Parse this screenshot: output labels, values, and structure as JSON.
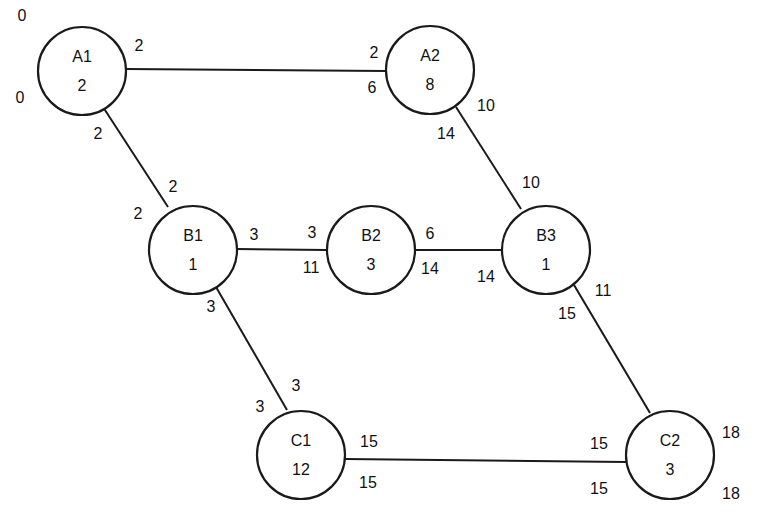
{
  "diagram": {
    "type": "network-schedule",
    "nodes": [
      {
        "id": "A1",
        "name": "A1",
        "duration": "2",
        "cx": 82,
        "cy": 71,
        "r": 44,
        "labels": [
          {
            "text": "0",
            "x": 22,
            "y": 17
          },
          {
            "text": "0",
            "x": 20,
            "y": 99
          }
        ]
      },
      {
        "id": "A2",
        "name": "A2",
        "duration": "8",
        "cx": 430,
        "cy": 70,
        "r": 44,
        "labels": []
      },
      {
        "id": "B1",
        "name": "B1",
        "duration": "1",
        "cx": 193,
        "cy": 250,
        "r": 44,
        "labels": []
      },
      {
        "id": "B2",
        "name": "B2",
        "duration": "3",
        "cx": 371,
        "cy": 250,
        "r": 44,
        "labels": []
      },
      {
        "id": "B3",
        "name": "B3",
        "duration": "1",
        "cx": 546,
        "cy": 250,
        "r": 44,
        "labels": []
      },
      {
        "id": "C1",
        "name": "C1",
        "duration": "12",
        "cx": 301,
        "cy": 455,
        "r": 44,
        "labels": []
      },
      {
        "id": "C2",
        "name": "C2",
        "duration": "3",
        "cx": 670,
        "cy": 455,
        "r": 44,
        "labels": [
          {
            "text": "18",
            "x": 731,
            "y": 434
          },
          {
            "text": "18",
            "x": 731,
            "y": 495
          }
        ]
      }
    ],
    "edges": [
      {
        "from": "A1",
        "to": "A2",
        "x1": 126,
        "y1": 69,
        "x2": 386,
        "y2": 71,
        "labels": [
          {
            "text": "2",
            "x": 139,
            "y": 47
          },
          {
            "text": "2",
            "x": 374,
            "y": 54
          },
          {
            "text": "6",
            "x": 372,
            "y": 89
          }
        ]
      },
      {
        "from": "A1",
        "to": "B1",
        "x1": 103,
        "y1": 107,
        "x2": 168,
        "y2": 207,
        "labels": [
          {
            "text": "2",
            "x": 98,
            "y": 135
          },
          {
            "text": "2",
            "x": 173,
            "y": 188
          },
          {
            "text": "2",
            "x": 138,
            "y": 215
          }
        ]
      },
      {
        "from": "B1",
        "to": "B2",
        "x1": 237,
        "y1": 249,
        "x2": 327,
        "y2": 250,
        "labels": [
          {
            "text": "3",
            "x": 254,
            "y": 236
          },
          {
            "text": "3",
            "x": 312,
            "y": 234
          },
          {
            "text": "11",
            "x": 311,
            "y": 269
          }
        ]
      },
      {
        "from": "B2",
        "to": "B3",
        "x1": 415,
        "y1": 250,
        "x2": 502,
        "y2": 250,
        "labels": [
          {
            "text": "6",
            "x": 430,
            "y": 235
          },
          {
            "text": "14",
            "x": 430,
            "y": 270
          },
          {
            "text": "14",
            "x": 486,
            "y": 278
          }
        ]
      },
      {
        "from": "A2",
        "to": "B3",
        "x1": 456,
        "y1": 107,
        "x2": 521,
        "y2": 209,
        "labels": [
          {
            "text": "10",
            "x": 486,
            "y": 107
          },
          {
            "text": "14",
            "x": 446,
            "y": 135
          },
          {
            "text": "10",
            "x": 531,
            "y": 184
          }
        ]
      },
      {
        "from": "B1",
        "to": "C1",
        "x1": 216,
        "y1": 287,
        "x2": 287,
        "y2": 410,
        "labels": [
          {
            "text": "3",
            "x": 211,
            "y": 308
          },
          {
            "text": "3",
            "x": 296,
            "y": 387
          },
          {
            "text": "3",
            "x": 260,
            "y": 408
          }
        ]
      },
      {
        "from": "B3",
        "to": "C2",
        "x1": 574,
        "y1": 285,
        "x2": 650,
        "y2": 413,
        "labels": [
          {
            "text": "11",
            "x": 603,
            "y": 292
          },
          {
            "text": "15",
            "x": 567,
            "y": 315
          }
        ]
      },
      {
        "from": "C1",
        "to": "C2",
        "x1": 345,
        "y1": 459,
        "x2": 626,
        "y2": 462,
        "labels": [
          {
            "text": "15",
            "x": 369,
            "y": 443
          },
          {
            "text": "15",
            "x": 368,
            "y": 484
          },
          {
            "text": "15",
            "x": 599,
            "y": 445
          },
          {
            "text": "15",
            "x": 599,
            "y": 490
          }
        ]
      }
    ]
  }
}
